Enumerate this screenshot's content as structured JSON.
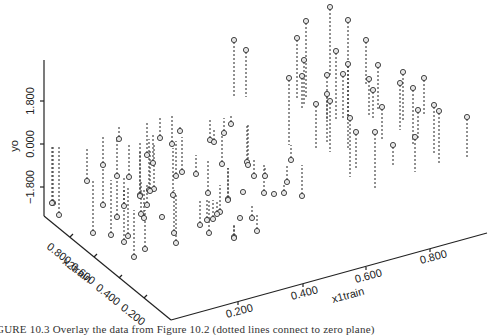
{
  "chart_data": {
    "type": "scatter",
    "subtype": "3d-scatter-with-drop-lines",
    "title": "",
    "axes": {
      "x": {
        "label": "x1train",
        "ticks": [
          "0.200",
          "0.400",
          "0.600",
          "0.800"
        ],
        "range": [
          0,
          1
        ]
      },
      "y": {
        "label": "x2train",
        "ticks": [
          "0.800",
          "0.600",
          "0.400",
          "0.200"
        ],
        "range": [
          0,
          1
        ]
      },
      "z": {
        "label": "yo",
        "ticks": [
          "1.800",
          "0.000",
          "−1.800"
        ],
        "range": [
          -2.5,
          4
        ]
      }
    },
    "grid": false,
    "legend": null,
    "note": "Points drawn as small circles with dotted vertical lines to the zero plane; values estimated from projected pixel positions.",
    "screen_points": [
      {
        "x": 330,
        "y": 7,
        "base": 75
      },
      {
        "x": 306,
        "y": 21,
        "base": 98
      },
      {
        "x": 348,
        "y": 20,
        "base": 120
      },
      {
        "x": 297,
        "y": 38,
        "base": 100
      },
      {
        "x": 234,
        "y": 40,
        "base": 97
      },
      {
        "x": 246,
        "y": 50,
        "base": 97
      },
      {
        "x": 366,
        "y": 40,
        "base": 86
      },
      {
        "x": 336,
        "y": 51,
        "base": 120
      },
      {
        "x": 304,
        "y": 60,
        "base": 105
      },
      {
        "x": 348,
        "y": 64,
        "base": 150
      },
      {
        "x": 378,
        "y": 65,
        "base": 110
      },
      {
        "x": 403,
        "y": 72,
        "base": 120
      },
      {
        "x": 343,
        "y": 74,
        "base": 120
      },
      {
        "x": 327,
        "y": 75,
        "base": 120
      },
      {
        "x": 302,
        "y": 76,
        "base": 108
      },
      {
        "x": 289,
        "y": 78,
        "base": 145
      },
      {
        "x": 369,
        "y": 79,
        "base": 115
      },
      {
        "x": 424,
        "y": 78,
        "base": 115
      },
      {
        "x": 400,
        "y": 83,
        "base": 130
      },
      {
        "x": 413,
        "y": 88,
        "base": 145
      },
      {
        "x": 373,
        "y": 90,
        "base": 120
      },
      {
        "x": 327,
        "y": 94,
        "base": 143
      },
      {
        "x": 330,
        "y": 101,
        "base": 152
      },
      {
        "x": 316,
        "y": 104,
        "base": 150
      },
      {
        "x": 434,
        "y": 105,
        "base": 155
      },
      {
        "x": 382,
        "y": 107,
        "base": 140
      },
      {
        "x": 418,
        "y": 110,
        "base": 140
      },
      {
        "x": 439,
        "y": 111,
        "base": 163
      },
      {
        "x": 467,
        "y": 117,
        "base": 157
      },
      {
        "x": 350,
        "y": 118,
        "base": 177
      },
      {
        "x": 231,
        "y": 124,
        "base": 115
      },
      {
        "x": 356,
        "y": 132,
        "base": 170
      },
      {
        "x": 375,
        "y": 132,
        "base": 188
      },
      {
        "x": 224,
        "y": 133,
        "base": 118
      },
      {
        "x": 180,
        "y": 131,
        "base": 125
      },
      {
        "x": 160,
        "y": 138,
        "base": 118
      },
      {
        "x": 119,
        "y": 139,
        "base": 127
      },
      {
        "x": 415,
        "y": 137,
        "base": 172
      },
      {
        "x": 210,
        "y": 140,
        "base": 120
      },
      {
        "x": 214,
        "y": 142,
        "base": 128
      },
      {
        "x": 172,
        "y": 144,
        "base": 116
      },
      {
        "x": 393,
        "y": 145,
        "base": 166
      },
      {
        "x": 147,
        "y": 155,
        "base": 122
      },
      {
        "x": 291,
        "y": 160,
        "base": 145
      },
      {
        "x": 153,
        "y": 163,
        "base": 135
      },
      {
        "x": 247,
        "y": 162,
        "base": 125
      },
      {
        "x": 222,
        "y": 164,
        "base": 135
      },
      {
        "x": 248,
        "y": 165,
        "base": 125
      },
      {
        "x": 103,
        "y": 165,
        "base": 135
      },
      {
        "x": 182,
        "y": 172,
        "base": 137
      },
      {
        "x": 196,
        "y": 174,
        "base": 155
      },
      {
        "x": 117,
        "y": 176,
        "base": 137
      },
      {
        "x": 176,
        "y": 176,
        "base": 141
      },
      {
        "x": 254,
        "y": 176,
        "base": 158
      },
      {
        "x": 265,
        "y": 176,
        "base": 166
      },
      {
        "x": 129,
        "y": 177,
        "base": 144
      },
      {
        "x": 87,
        "y": 181,
        "base": 147
      },
      {
        "x": 287,
        "y": 182,
        "base": 166
      },
      {
        "x": 154,
        "y": 189,
        "base": 145
      },
      {
        "x": 149,
        "y": 190,
        "base": 139
      },
      {
        "x": 243,
        "y": 192,
        "base": 192
      },
      {
        "x": 264,
        "y": 193,
        "base": 165
      },
      {
        "x": 284,
        "y": 193,
        "base": 185
      },
      {
        "x": 274,
        "y": 194,
        "base": 194
      },
      {
        "x": 208,
        "y": 193,
        "base": 160
      },
      {
        "x": 173,
        "y": 195,
        "base": 148
      },
      {
        "x": 140,
        "y": 195,
        "base": 143
      },
      {
        "x": 302,
        "y": 196,
        "base": 165
      },
      {
        "x": 140,
        "y": 196,
        "base": 150
      },
      {
        "x": 150,
        "y": 191,
        "base": 151
      },
      {
        "x": 228,
        "y": 199,
        "base": 168
      },
      {
        "x": 228,
        "y": 200,
        "base": 168
      },
      {
        "x": 53,
        "y": 203,
        "base": 147
      },
      {
        "x": 52,
        "y": 203,
        "base": 147
      },
      {
        "x": 103,
        "y": 205,
        "base": 167
      },
      {
        "x": 124,
        "y": 206,
        "base": 176
      },
      {
        "x": 147,
        "y": 205,
        "base": 185
      },
      {
        "x": 220,
        "y": 212,
        "base": 185
      },
      {
        "x": 141,
        "y": 214,
        "base": 180
      },
      {
        "x": 59,
        "y": 215,
        "base": 147
      },
      {
        "x": 217,
        "y": 214,
        "base": 200
      },
      {
        "x": 117,
        "y": 217,
        "base": 180
      },
      {
        "x": 162,
        "y": 217,
        "base": 214
      },
      {
        "x": 144,
        "y": 218,
        "base": 188
      },
      {
        "x": 213,
        "y": 219,
        "base": 200
      },
      {
        "x": 240,
        "y": 218,
        "base": 218
      },
      {
        "x": 252,
        "y": 218,
        "base": 205
      },
      {
        "x": 207,
        "y": 220,
        "base": 200
      },
      {
        "x": 200,
        "y": 225,
        "base": 200
      },
      {
        "x": 257,
        "y": 231,
        "base": 215
      },
      {
        "x": 93,
        "y": 233,
        "base": 180
      },
      {
        "x": 174,
        "y": 233,
        "base": 190
      },
      {
        "x": 209,
        "y": 233,
        "base": 200
      },
      {
        "x": 111,
        "y": 235,
        "base": 180
      },
      {
        "x": 128,
        "y": 236,
        "base": 188
      },
      {
        "x": 234,
        "y": 237,
        "base": 225
      },
      {
        "x": 234,
        "y": 238,
        "base": 225
      },
      {
        "x": 124,
        "y": 242,
        "base": 188
      },
      {
        "x": 176,
        "y": 243,
        "base": 195
      },
      {
        "x": 145,
        "y": 249,
        "base": 210
      },
      {
        "x": 134,
        "y": 257,
        "base": 210
      }
    ]
  },
  "figure": {
    "z_axis_label": "yo",
    "z_ticks": [
      "1.800",
      "0.000",
      "−1.800"
    ],
    "x2_axis_label": "x2train",
    "x2_ticks": [
      "0.800",
      "0.600",
      "0.400",
      "0.200"
    ],
    "x1_axis_label": "x1train",
    "x1_ticks": [
      "0.200",
      "0.400",
      "0.600",
      "0.800"
    ],
    "caption": "GURE 10.3   Overlay the data from Figure 10.2 (dotted lines connect to zero plane)"
  }
}
